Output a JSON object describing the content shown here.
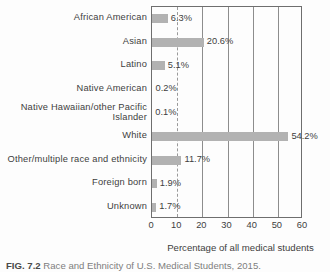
{
  "figure": {
    "caption_label": "FIG. 7.2",
    "caption_text": "Race and Ethnicity of U.S. Medical Students, 2015."
  },
  "chart_data": {
    "type": "bar",
    "orientation": "horizontal",
    "title": "",
    "xlabel": "Percentage of all medical students",
    "ylabel": "",
    "xlim": [
      0,
      60
    ],
    "xticks": [
      0,
      10,
      20,
      30,
      40,
      50,
      60
    ],
    "grid": "vertical",
    "legend": "none",
    "bar_color": "#b2b2b2",
    "categories": [
      "African American",
      "Asian",
      "Latino",
      "Native American",
      "Native Hawaiian/other Pacific Islander",
      "White",
      "Other/multiple race and ethnicity",
      "Foreign born",
      "Unknown"
    ],
    "values": [
      6.3,
      20.6,
      5.1,
      0.2,
      0.1,
      54.2,
      11.7,
      1.9,
      1.7
    ],
    "value_labels": [
      "6.3%",
      "20.6%",
      "5.1%",
      "0.2%",
      "0.1%",
      "54.2%",
      "11.7%",
      "1.9%",
      "1.7%"
    ]
  }
}
